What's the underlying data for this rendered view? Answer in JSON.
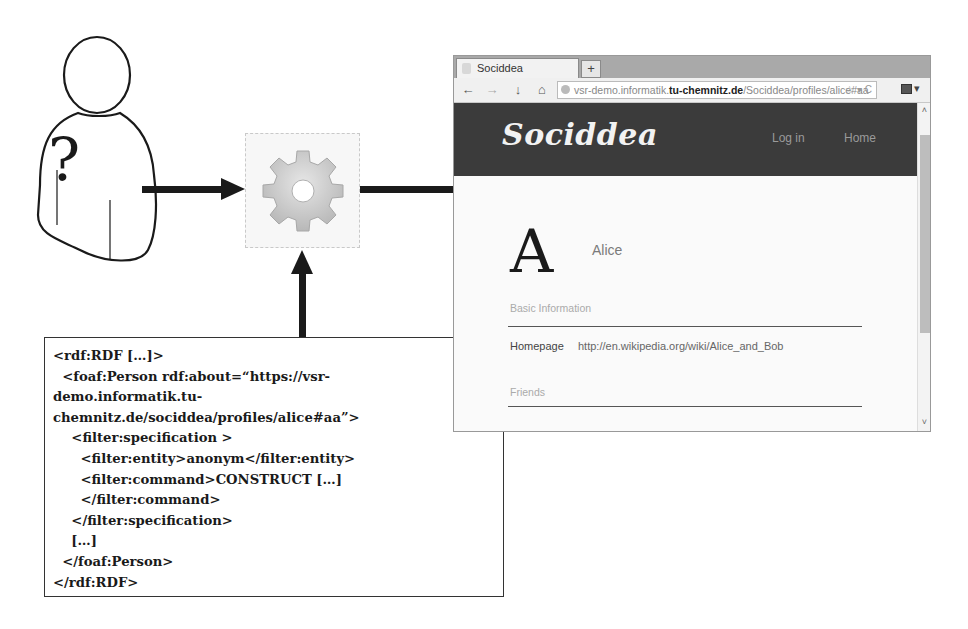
{
  "diagram": {
    "user": {
      "label": "?",
      "icon": "unknown-user-icon"
    },
    "processor": {
      "icon": "gear-icon"
    },
    "arrows": [
      {
        "from": "user",
        "to": "processor"
      },
      {
        "from": "processor",
        "to": "browser"
      },
      {
        "from": "rdf-spec",
        "to": "processor"
      }
    ],
    "rdf_code": {
      "lines": [
        "<rdf:RDF […]>",
        "  <foaf:Person rdf:about=“https://vsr-",
        "demo.informatik.tu-",
        "chemnitz.de/sociddea/profiles/alice#aa”>",
        "    <filter:specification >",
        "      <filter:entity>anonym</filter:entity>",
        "      <filter:command>CONSTRUCT […]",
        "      </filter:command>",
        "    </filter:specification>",
        "    […]",
        "  </foaf:Person>",
        "</rdf:RDF>"
      ]
    }
  },
  "browser": {
    "tab": {
      "title": "Sociddea",
      "new_tab": "+"
    },
    "nav": {
      "back": "←",
      "forward": "→",
      "download": "↓",
      "home": "⌂"
    },
    "url": {
      "prefix": "vsr-demo.informatik.",
      "host": "tu-chemnitz.de",
      "path": "/Sociddea/profiles/alice#aa",
      "icons": "☆ ▾ C"
    },
    "menu": "▾",
    "site": {
      "logo": "Sociddea",
      "nav": {
        "login": "Log in",
        "home": "Home"
      },
      "avatar_letter": "A",
      "name": "Alice",
      "sections": {
        "basic": "Basic Information",
        "friends": "Friends"
      },
      "homepage": {
        "label": "Homepage",
        "value": "http://en.wikipedia.org/wiki/Alice_and_Bob"
      }
    },
    "scroll": {
      "up": "˄",
      "down": "˅"
    }
  },
  "colors": {
    "header_bg": "#3b3b3b",
    "arrow": "#1a1a1a"
  }
}
